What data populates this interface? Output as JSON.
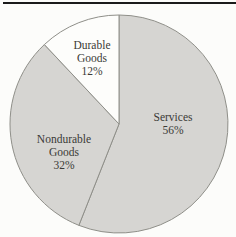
{
  "figure": {
    "background": "#fcfcfa",
    "top_rule_color": "#1b1b1b"
  },
  "chart_data": {
    "type": "pie",
    "title": "",
    "categories": [
      "Services",
      "Nondurable Goods",
      "Durable Goods"
    ],
    "values": [
      56,
      32,
      12
    ],
    "unit": "%",
    "direction": "clockwise",
    "start_angle_deg": 0,
    "legend": "none",
    "labels_inside_slices": true,
    "stroke_color": "#8f8f89",
    "label_color": "#3a3a36",
    "slices": [
      {
        "label": "Services",
        "value": 56,
        "pct_label": "56%",
        "fill": "#d6d5d2",
        "label_x": 173,
        "label_y": 121
      },
      {
        "label": "Nondurable Goods",
        "value": 32,
        "pct_label": "32%",
        "fill": "#d6d5d2",
        "label_x": 64,
        "label_y": 143
      },
      {
        "label": "Durable Goods",
        "value": 12,
        "pct_label": "12%",
        "fill": "#fdfdfb",
        "label_x": 92,
        "label_y": 49
      }
    ]
  }
}
